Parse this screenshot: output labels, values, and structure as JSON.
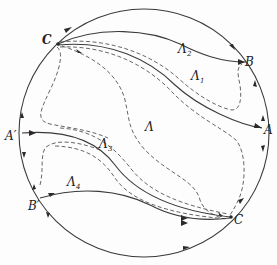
{
  "figure": {
    "type": "phase-portrait-on-disk",
    "boundary": "circle",
    "points": [
      {
        "id": "C_top",
        "label": "C",
        "x": 47,
        "y": 42
      },
      {
        "id": "B",
        "label": "B",
        "x": 248,
        "y": 62
      },
      {
        "id": "A",
        "label": "A",
        "x": 267,
        "y": 128
      },
      {
        "id": "A_prime",
        "label": "A′",
        "x": 12,
        "y": 136
      },
      {
        "id": "B_prime",
        "label": "B′",
        "x": 38,
        "y": 204
      },
      {
        "id": "C_bottom",
        "label": "C",
        "x": 235,
        "y": 219
      }
    ],
    "curves": [
      {
        "id": "Lambda2",
        "label": "Λ",
        "subscript": "2",
        "style": "solid",
        "from": "C_top",
        "to": "B"
      },
      {
        "id": "Lambda1",
        "label": "Λ",
        "subscript": "1",
        "style": "solid",
        "from": "C_top",
        "to": "A"
      },
      {
        "id": "Lambda3",
        "label": "Λ",
        "subscript": "3",
        "style": "solid",
        "from": "A_prime",
        "to": "C_bottom"
      },
      {
        "id": "Lambda4",
        "label": "Λ",
        "subscript": "4",
        "style": "solid",
        "from": "B_prime",
        "to": "C_bottom"
      },
      {
        "id": "Lambda",
        "label": "Λ",
        "subscript": "",
        "style": "dashed",
        "from": "C_top",
        "to": "C_bottom"
      }
    ]
  },
  "labels": {
    "C_top": "C",
    "B": "B",
    "A": "A",
    "A_prime": "A′",
    "B_prime": "B′",
    "C_bottom": "C",
    "Lambda": "Λ",
    "Lambda1": "Λ",
    "Lambda1_sub": "1",
    "Lambda2": "Λ",
    "Lambda2_sub": "2",
    "Lambda3": "Λ",
    "Lambda3_sub": "3",
    "Lambda4": "Λ",
    "Lambda4_sub": "4"
  }
}
